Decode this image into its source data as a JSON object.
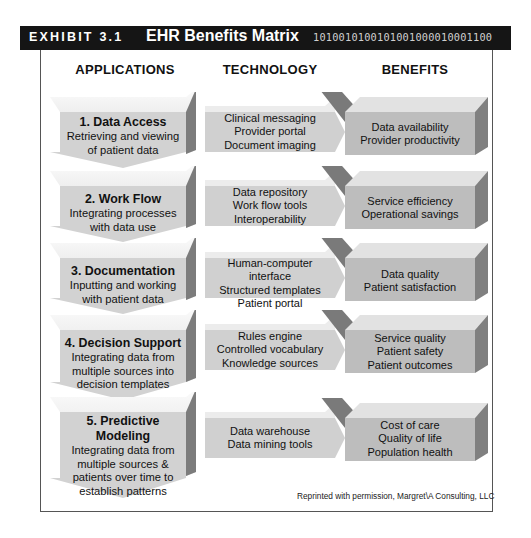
{
  "header": {
    "exhibit_label": "EXHIBIT 3.1",
    "title": "EHR Benefits Matrix",
    "binary_decoration": "1010010100101001000010001100"
  },
  "columns": {
    "applications": "APPLICATIONS",
    "technology": "TECHNOLOGY",
    "benefits": "BENEFITS"
  },
  "rows": [
    {
      "application": {
        "title": "1. Data Access",
        "lines": [
          "Retrieving and viewing",
          "of patient data"
        ]
      },
      "technology": [
        "Clinical messaging",
        "Provider portal",
        "Document imaging"
      ],
      "benefits": [
        "Data availability",
        "Provider productivity"
      ]
    },
    {
      "application": {
        "title": "2. Work Flow",
        "lines": [
          "Integrating processes",
          "with data use"
        ]
      },
      "technology": [
        "Data repository",
        "Work flow tools",
        "Interoperability"
      ],
      "benefits": [
        "Service efficiency",
        "Operational savings"
      ]
    },
    {
      "application": {
        "title": "3. Documentation",
        "lines": [
          "Inputting and working",
          "with patient data"
        ]
      },
      "technology": [
        "Human-computer interface",
        "Structured templates",
        "Patient portal"
      ],
      "benefits": [
        "Data quality",
        "Patient satisfaction"
      ]
    },
    {
      "application": {
        "title": "4. Decision Support",
        "lines": [
          "Integrating data from",
          "multiple sources into",
          "decision templates"
        ]
      },
      "technology": [
        "Rules engine",
        "Controlled vocabulary",
        "Knowledge sources"
      ],
      "benefits": [
        "Service quality",
        "Patient safety",
        "Patient outcomes"
      ]
    },
    {
      "application": {
        "title": "5. Predictive Modeling",
        "lines": [
          "Integrating data from",
          "multiple sources &",
          "patients over time to",
          "establish patterns"
        ]
      },
      "technology": [
        "Data warehouse",
        "Data mining tools"
      ],
      "benefits": [
        "Cost of care",
        "Quality of life",
        "Population health"
      ]
    }
  ],
  "credit": "Reprinted with permission, Margret\\A Consulting, LLC",
  "colors": {
    "title_bar": "#151515",
    "app_front": "#d2d2d2",
    "app_side": "#7c7c7c",
    "tech_front": "#d0d0d0",
    "connector": "#7a7a7a",
    "benefit_front": "#bdbdbd",
    "benefit_side": "#808080",
    "benefit_top": "#e2e2e2"
  }
}
